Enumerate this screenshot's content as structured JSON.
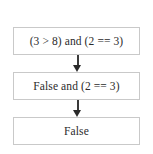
{
  "diagram": {
    "orientation": "vertical",
    "background_color": "#ffffff",
    "box_border_color": "#c9c9c9",
    "arrow_color": "#2a2a2a",
    "text_color": "#2b2b2b",
    "nodes": [
      {
        "id": "step-1",
        "label": "(3 > 8) and (2 == 3)"
      },
      {
        "id": "step-2",
        "label": "False and (2 == 3)"
      },
      {
        "id": "step-3",
        "label": "False"
      }
    ],
    "arrows": [
      {
        "id": "arrow-1",
        "from": "step-1",
        "to": "step-2",
        "direction": "down",
        "label": ""
      },
      {
        "id": "arrow-2",
        "from": "step-2",
        "to": "step-3",
        "direction": "down",
        "label": ""
      }
    ]
  }
}
